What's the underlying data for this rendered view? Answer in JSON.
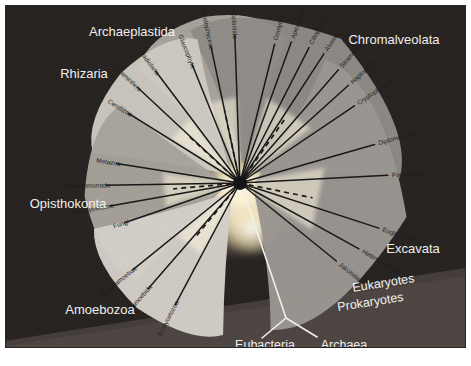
{
  "figure": {
    "background_color": "#231f1d",
    "prokaryote_band_color": "#4a423e",
    "border_color": "#241f1e",
    "center_node_color": "#101010",
    "branch_color": "#141414",
    "label_color_supergroup": "#f2f0ee",
    "label_color_taxon": "#1a1a1a",
    "glow_color": "#fff6dd"
  },
  "supergroups": [
    {
      "id": "archaeplastida",
      "label": "Archaeplastida",
      "label_x": 132,
      "label_y": 36,
      "blob_color": "#a9a59d",
      "taxa": [
        {
          "label": "Glaucophyta",
          "angle": -112,
          "length": 128
        },
        {
          "label": "Rhodophyceae",
          "angle": -102,
          "length": 140
        },
        {
          "label": "Chloroplastida",
          "angle": -92,
          "length": 148
        }
      ]
    },
    {
      "id": "chromalveolata",
      "label": "Chromalveolata",
      "label_x": 394,
      "label_y": 44,
      "blob_color": "#8d8a86",
      "taxa": [
        {
          "label": "Oomycota",
          "angle": -76,
          "length": 143
        },
        {
          "label": "Apicomplexa",
          "angle": -70,
          "length": 150
        },
        {
          "label": "Ciliophora",
          "angle": -63,
          "length": 152
        },
        {
          "label": "Alveolata",
          "angle": -57,
          "length": 154
        },
        {
          "label": "Stramenopiles",
          "angle": -49,
          "length": 150
        },
        {
          "label": "Haptophyta",
          "angle": -42,
          "length": 146
        },
        {
          "label": "Cryptophyceae",
          "angle": -34,
          "length": 138
        }
      ]
    },
    {
      "id": "rhizaria",
      "label": "Rhizaria",
      "label_x": 84,
      "label_y": 78,
      "blob_color": "#cdc9c1",
      "taxa": [
        {
          "label": "Cercozoa",
          "angle": -148,
          "length": 132
        },
        {
          "label": "Foraminifera",
          "angle": -137,
          "length": 140
        },
        {
          "label": "Radiolaria",
          "angle": -127,
          "length": 140
        }
      ]
    },
    {
      "id": "opisthokonta",
      "label": "Opisthokonta",
      "label_x": 68,
      "label_y": 208,
      "blob_color": "#a6a29a",
      "taxa": [
        {
          "label": "Metazoa",
          "angle": 189,
          "length": 125
        },
        {
          "label": "Choanomonada",
          "angle": 179,
          "length": 134
        },
        {
          "label": "Mesomycetozoa",
          "angle": 170,
          "length": 132
        },
        {
          "label": "Fungi",
          "angle": 161,
          "length": 122
        }
      ]
    },
    {
      "id": "amoebozoa",
      "label": "Amoebozoa",
      "label_x": 100,
      "label_y": 314,
      "blob_color": "#d4d0c8",
      "taxa": [
        {
          "label": "Mastigamoebae",
          "angle": 141,
          "length": 138
        },
        {
          "label": "Entamoebida",
          "angle": 131,
          "length": 140
        },
        {
          "label": "Eumycetozoa",
          "angle": 118,
          "length": 138
        }
      ]
    },
    {
      "id": "excavata",
      "label": "Excavata",
      "label_x": 413,
      "label_y": 253,
      "blob_color": "#999590",
      "taxa": [
        {
          "label": "Diplomonadida",
          "angle": -16,
          "length": 140
        },
        {
          "label": "Parabasalia",
          "angle": -3,
          "length": 148
        },
        {
          "label": "Euglenozoa",
          "angle": 18,
          "length": 146
        },
        {
          "label": "Heterolobosea",
          "angle": 29,
          "length": 136
        },
        {
          "label": "Jakobida",
          "angle": 39,
          "length": 124
        }
      ]
    }
  ],
  "domain_labels": {
    "eukaryotes": "Eukaryotes",
    "prokaryotes": "Prokaryotes",
    "eubacteria": "Eubacteria",
    "archaea": "Archaea"
  },
  "chart_data": {
    "type": "diagram",
    "subtype": "unrooted-phylogenetic-tree",
    "root_node": {
      "x": 240,
      "y": 183
    },
    "supergroup_count": 6,
    "taxon_count": 25,
    "supergroup_names": [
      "Archaeplastida",
      "Chromalveolata",
      "Rhizaria",
      "Opisthokonta",
      "Amoebozoa",
      "Excavata"
    ],
    "taxa_by_supergroup": {
      "Archaeplastida": [
        "Glaucophyta",
        "Rhodophyceae",
        "Chloroplastida"
      ],
      "Chromalveolata": [
        "Oomycota",
        "Apicomplexa",
        "Ciliophora",
        "Alveolata",
        "Stramenopiles",
        "Haptophyta",
        "Cryptophyceae"
      ],
      "Rhizaria": [
        "Cercozoa",
        "Foraminifera",
        "Radiolaria"
      ],
      "Opisthokonta": [
        "Metazoa",
        "Choanomonada",
        "Mesomycetozoa",
        "Fungi"
      ],
      "Amoebozoa": [
        "Mastigamoebae",
        "Entamoebida",
        "Eumycetozoa"
      ],
      "Excavata": [
        "Diplomonadida",
        "Parabasalia",
        "Euglenozoa",
        "Heterolobosea",
        "Jakobida"
      ]
    },
    "outgroup_branches": [
      "Eubacteria",
      "Archaea"
    ],
    "domain_divider_labels": [
      "Eukaryotes",
      "Prokaryotes"
    ],
    "legend": "none",
    "grid": false
  }
}
